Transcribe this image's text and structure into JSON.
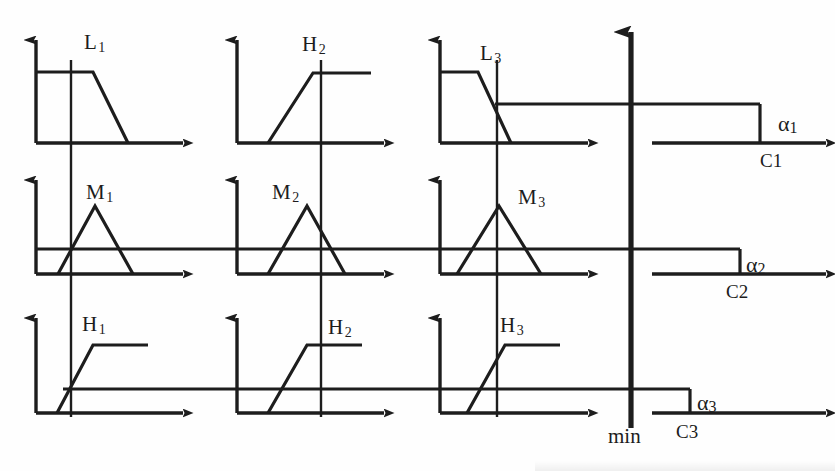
{
  "diagram": {
    "ink_color": "#1d1d1d",
    "background": "#fefefe",
    "aggregation_operator": "min",
    "rows": [
      {
        "row_index": 1,
        "alpha": {
          "label": "α",
          "sub": "1"
        },
        "output": {
          "label": "C",
          "sub": "1"
        },
        "antecedents": [
          {
            "name": "L",
            "sub": "1",
            "shape": "trapezoid-falling"
          },
          {
            "name": "H",
            "sub": "2",
            "shape": "ramp-rising"
          },
          {
            "name": "L",
            "sub": "3",
            "shape": "trapezoid-falling"
          }
        ]
      },
      {
        "row_index": 2,
        "alpha": {
          "label": "α",
          "sub": "2"
        },
        "output": {
          "label": "C",
          "sub": "2"
        },
        "antecedents": [
          {
            "name": "M",
            "sub": "1",
            "shape": "triangle"
          },
          {
            "name": "M",
            "sub": "2",
            "shape": "triangle"
          },
          {
            "name": "M",
            "sub": "3",
            "shape": "triangle"
          }
        ]
      },
      {
        "row_index": 3,
        "alpha": {
          "label": "α",
          "sub": "3"
        },
        "output": {
          "label": "C",
          "sub": "3"
        },
        "antecedents": [
          {
            "name": "H",
            "sub": "1",
            "shape": "ramp-rising"
          },
          {
            "name": "H",
            "sub": "2",
            "shape": "ramp-rising"
          },
          {
            "name": "H",
            "sub": "3",
            "shape": "ramp-rising"
          }
        ]
      }
    ],
    "min_axis_label": "min",
    "labels": {
      "L1": "L",
      "L1_sub": "1",
      "H2_top": "H",
      "H2_top_sub": "2",
      "L3": "L",
      "L3_sub": "3",
      "M1": "M",
      "M1_sub": "1",
      "M2": "M",
      "M2_sub": "2",
      "M3": "M",
      "M3_sub": "3",
      "H1": "H",
      "H1_sub": "1",
      "H2_bot": "H",
      "H2_bot_sub": "2",
      "H3": "H",
      "H3_sub": "3",
      "alpha1": "α",
      "alpha1_sub": "1",
      "alpha2": "α",
      "alpha2_sub": "2",
      "alpha3": "α",
      "alpha3_sub": "3",
      "C1": "C1",
      "C2": "C2",
      "C3": "C3",
      "min": "min"
    }
  }
}
